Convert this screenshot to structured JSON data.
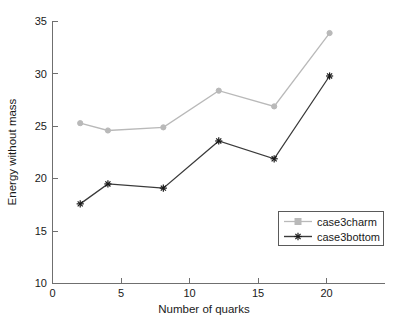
{
  "chart_data": {
    "type": "line",
    "title": "",
    "xlabel": "Number of quarks",
    "ylabel": "Energy without mass",
    "x": [
      2,
      4,
      8,
      12,
      16,
      20
    ],
    "xlim": [
      0,
      24
    ],
    "ylim": [
      10,
      35
    ],
    "xticks": [
      0,
      5,
      10,
      15,
      20
    ],
    "xticklabels": [
      "0",
      "5",
      "10",
      "15",
      "20"
    ],
    "yticks": [
      10,
      15,
      20,
      25,
      30,
      35
    ],
    "yticklabels": [
      "10",
      "15",
      "20",
      "25",
      "30",
      "35"
    ],
    "grid": false,
    "legend_position": "lower right",
    "series": [
      {
        "name": "case3charm",
        "values": [
          25.3,
          24.6,
          24.9,
          28.4,
          26.9,
          33.9
        ],
        "color": "#b9b9b9",
        "marker": "circle"
      },
      {
        "name": "case3bottom",
        "values": [
          17.6,
          19.5,
          19.1,
          23.6,
          21.9,
          29.8
        ],
        "color": "#3a3a3a",
        "marker": "asterisk"
      }
    ]
  },
  "axes": {
    "x_tick_0": "0",
    "x_tick_1": "5",
    "x_tick_2": "10",
    "x_tick_3": "15",
    "x_tick_4": "20",
    "y_tick_0": "10",
    "y_tick_1": "15",
    "y_tick_2": "20",
    "y_tick_3": "25",
    "y_tick_4": "30",
    "y_tick_5": "35",
    "x_title": "Number of quarks",
    "y_title": "Energy without mass"
  },
  "legend": {
    "entry_0": "case3charm",
    "entry_1": "case3bottom"
  }
}
